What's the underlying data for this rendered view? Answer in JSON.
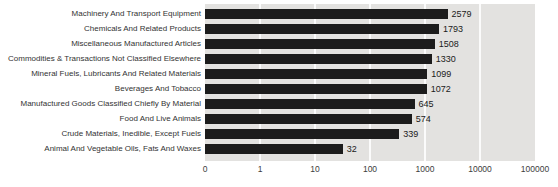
{
  "chart_data": {
    "type": "bar",
    "orientation": "horizontal",
    "title": "",
    "xlabel": "",
    "ylabel": "",
    "xscale": "log",
    "xmin": 0.1,
    "xmax": 100000,
    "grid": "vertical white gridlines on gray plot background",
    "legend_position": "none",
    "categories": [
      "Machinery And Transport Equipment",
      "Chemicals And Related Products",
      "Miscellaneous Manufactured Articles",
      "Commodities & Transactions Not Classified Elsewhere",
      "Mineral Fuels, Lubricants And Related Materials",
      "Beverages And Tobacco",
      "Manufactured Goods Classified Chiefly By Material",
      "Food And Live Animals",
      "Crude Materials, Inedible, Except Fuels",
      "Animal And Vegetable Oils, Fats And Waxes"
    ],
    "values": [
      2579,
      1793,
      1508,
      1330,
      1099,
      1072,
      645,
      574,
      339,
      32
    ],
    "value_labels": [
      "2579",
      "1793",
      "1508",
      "1330",
      "1099",
      "1072",
      "645",
      "574",
      "339",
      "32"
    ],
    "x_tick_labels": [
      "0",
      "1",
      "10",
      "100",
      "1000",
      "10000",
      "100000"
    ],
    "colors": {
      "bar": "#1c1c1c",
      "plot_background": "#e3e2e0",
      "gridline": "#fbfbfb",
      "category_text": "#333333",
      "value_text": "#1a1a1a",
      "tick_text": "#3d3d3d",
      "page_background": "#ffffff"
    }
  }
}
